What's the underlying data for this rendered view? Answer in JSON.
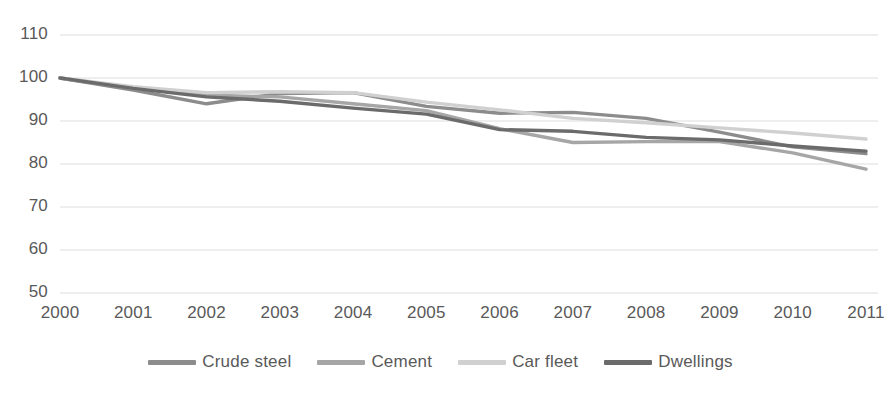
{
  "chart_data": {
    "type": "line",
    "title": "",
    "subtitle": "",
    "xlabel": "",
    "ylabel": "",
    "x": [
      "2000",
      "2001",
      "2002",
      "2003",
      "2004",
      "2005",
      "2006",
      "2007",
      "2008",
      "2009",
      "2010",
      "2011"
    ],
    "categories": [
      "2000",
      "2001",
      "2002",
      "2003",
      "2004",
      "2005",
      "2006",
      "2007",
      "2008",
      "2009",
      "2010",
      "2011"
    ],
    "xlim": [
      "2000",
      "2011"
    ],
    "ylim": [
      50,
      110
    ],
    "yticks": [
      50,
      60,
      70,
      80,
      90,
      100,
      110
    ],
    "ytick_labels": [
      "50",
      "60",
      "70",
      "80",
      "90",
      "100",
      "110"
    ],
    "grid": true,
    "grid_axis": "y",
    "grid_color": "#e8e8e8",
    "legend_position": "bottom",
    "background": "#ffffff",
    "series": [
      {
        "name": "Crude steel",
        "color": "#8c8c8c",
        "values": [
          100,
          97.2,
          94.0,
          96.4,
          96.6,
          93.4,
          91.8,
          92.0,
          90.6,
          87.4,
          84.0,
          82.4
        ]
      },
      {
        "name": "Cement",
        "color": "#a6a6a6",
        "values": [
          100,
          97.6,
          96.0,
          95.6,
          94.0,
          92.4,
          88.2,
          85.0,
          85.2,
          85.2,
          82.6,
          78.8
        ]
      },
      {
        "name": "Car fleet",
        "color": "#d0d0d0",
        "values": [
          100,
          98.0,
          96.6,
          96.8,
          96.6,
          94.4,
          92.6,
          90.6,
          89.6,
          88.4,
          87.2,
          85.8
        ]
      },
      {
        "name": "Dwellings",
        "color": "#6b6b6b",
        "values": [
          100,
          97.6,
          95.6,
          94.6,
          93.0,
          91.6,
          88.0,
          87.6,
          86.2,
          85.6,
          84.2,
          83.0
        ]
      }
    ]
  },
  "axis": {
    "y_tick_labels": [
      "110",
      "100",
      "90",
      "80",
      "70",
      "60",
      "50"
    ],
    "x_tick_labels": [
      "2000",
      "2001",
      "2002",
      "2003",
      "2004",
      "2005",
      "2006",
      "2007",
      "2008",
      "2009",
      "2010",
      "2011"
    ]
  },
  "legend": {
    "items": [
      {
        "label": "Crude steel",
        "color": "#8c8c8c"
      },
      {
        "label": "Cement",
        "color": "#a6a6a6"
      },
      {
        "label": "Car fleet",
        "color": "#d0d0d0"
      },
      {
        "label": "Dwellings",
        "color": "#6b6b6b"
      }
    ]
  }
}
